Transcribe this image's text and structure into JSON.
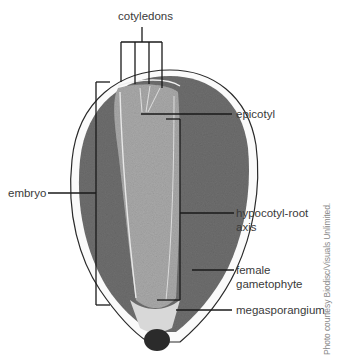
{
  "figure": {
    "colors": {
      "background": "#ffffff",
      "outer_tissue": "#6e6e6e",
      "embryo_tissue": "#a9a9a9",
      "seed_coat_line": "#2a2a2a",
      "megasporangium_tip": "#2b2b2b",
      "label_lines": "#1a1a1a",
      "label_text": "#3a3a3a",
      "credit_text": "#8a8a8a"
    }
  },
  "labels": {
    "cotyledons": "cotyledons",
    "epicotyl": "epicotyl",
    "embryo": "embryo",
    "hypocotyl_root_line1": "hypocotyl-root",
    "hypocotyl_root_line2": "axis",
    "female_gametophyte_line1": "female",
    "female_gametophyte_line2": "gametophyte",
    "megasporangium": "megasporangium"
  },
  "credit": "Photo courtesy Biodisc/Visuals Unlimited."
}
